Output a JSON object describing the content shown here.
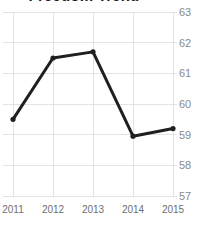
{
  "chart_data": {
    "type": "line",
    "title": "Freedom Trend",
    "xlabel": "",
    "ylabel": "",
    "categories": [
      "2011",
      "2012",
      "2013",
      "2014",
      "2015"
    ],
    "x": [
      2011,
      2012,
      2013,
      2014,
      2015
    ],
    "values": [
      59.5,
      61.5,
      61.7,
      58.95,
      59.2
    ],
    "series": [
      {
        "name": "Freedom Trend",
        "values": [
          59.5,
          61.5,
          61.7,
          58.95,
          59.2
        ]
      }
    ],
    "ylim": [
      57,
      63
    ],
    "yticks": [
      57,
      58,
      59,
      60,
      61,
      62,
      63
    ],
    "ytick_labels": [
      "57",
      "58",
      "59",
      "60",
      "61",
      "62",
      "63"
    ],
    "xticks": [
      2011,
      2012,
      2013,
      2014,
      2015
    ],
    "grid": true,
    "grid_axis": "both",
    "legend": false,
    "legend_position": "none",
    "y_axis_side": "right",
    "markers": true,
    "line_color": "#1f1f1f",
    "marker_color": "#1f1f1f",
    "grid_color": "#e3e3e6",
    "tick_label_color": "#8a8a8a",
    "background_color": "#ffffff"
  }
}
